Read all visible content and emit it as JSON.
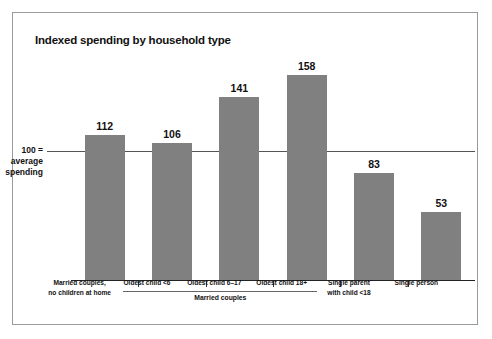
{
  "chart_data": {
    "type": "bar",
    "title": "Indexed spending by household type",
    "xlabel": "",
    "ylabel": "",
    "ylim": [
      0,
      175
    ],
    "grid": false,
    "legend": "none",
    "categories": [
      "Married couples, no children at home",
      "Oldest child <6",
      "Oldest child 6–17",
      "Oldest child 18+",
      "Single parent with child <18",
      "Single person"
    ],
    "category_lines": [
      [
        "Married couples,",
        "no children at home"
      ],
      [
        "Oldest child <6"
      ],
      [
        "Oldest child 6–17"
      ],
      [
        "Oldest child 18+"
      ],
      [
        "Single parent",
        "with child <18"
      ],
      [
        "Single person"
      ]
    ],
    "values": [
      112,
      106,
      141,
      158,
      83,
      53
    ],
    "reference_line": {
      "value": 100,
      "label_lines": [
        "100 =",
        "average",
        "spending"
      ]
    },
    "group_bracket": {
      "label": "Married couples",
      "covers": [
        "Oldest child <6",
        "Oldest child 6–17",
        "Oldest child 18+"
      ]
    },
    "colors": {
      "bar": "#808080",
      "axis": "#222222",
      "reference_line": "#555555",
      "text": "#111111",
      "frame": "#9a9a9a",
      "background": "#ffffff"
    }
  }
}
